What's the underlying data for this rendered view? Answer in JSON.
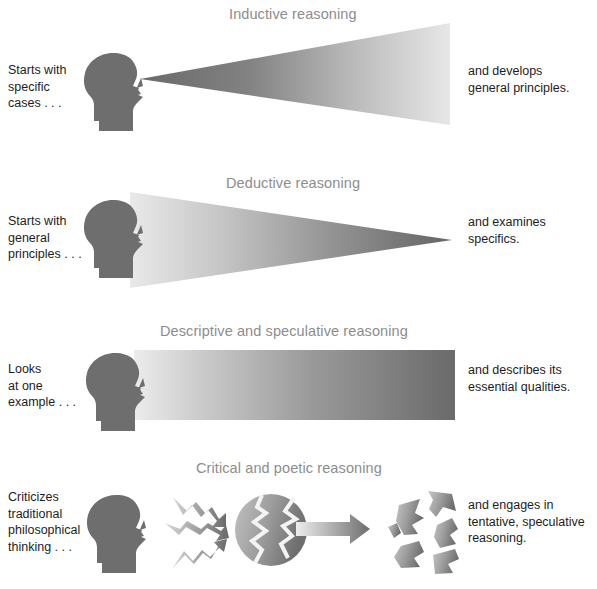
{
  "figure": {
    "width": 597,
    "height": 589,
    "background": "#ffffff",
    "title_color": "#8d8d8d",
    "caption_color": "#1d1d1d",
    "silhouette_color": "#6e6e6e",
    "gradient_dark": "#6b6b6b",
    "gradient_light": "#ebebeb"
  },
  "panels": [
    {
      "id": "inductive",
      "title": "Inductive reasoning",
      "left_caption": "Starts with\nspecific\ncases . . .",
      "left_caption_lines": [
        "Starts with",
        "specific",
        "cases . . ."
      ],
      "right_caption_lines": [
        "and develops",
        "general principles."
      ],
      "shape": "expanding-triangle",
      "shape_description": "Triangle with apex at the head's eye, widening toward the right",
      "gradient_direction": "dark-left-to-light-right"
    },
    {
      "id": "deductive",
      "title": "Deductive reasoning",
      "left_caption_lines": [
        "Starts with",
        "general",
        "principles . . ."
      ],
      "right_caption_lines": [
        "and examines",
        "specifics."
      ],
      "shape": "converging-triangle",
      "shape_description": "Triangle with wide base at the head, narrowing to an apex at the right",
      "gradient_direction": "light-left-to-dark-right"
    },
    {
      "id": "descriptive-speculative",
      "title": "Descriptive and speculative reasoning",
      "left_caption_lines": [
        "Looks",
        "at one",
        "example . . ."
      ],
      "right_caption_lines": [
        "and describes its",
        "essential qualities."
      ],
      "shape": "rectangle",
      "shape_description": "Constant-width band extending from the head to the right",
      "gradient_direction": "light-left-to-dark-right"
    },
    {
      "id": "critical-poetic",
      "title": "Critical and poetic reasoning",
      "left_caption_lines": [
        "Criticizes",
        "traditional",
        "philosophical",
        "thinking . . ."
      ],
      "right_caption_lines": [
        "and engages in",
        "tentative, speculative",
        "reasoning."
      ],
      "shape": "zigzag-arrows-cracking-sphere",
      "shape_description": "Three zigzag arrows strike a cracked sphere; a straight arrow leads to the shattered sphere",
      "gradient_direction": "light-tail-to-dark-head"
    }
  ]
}
